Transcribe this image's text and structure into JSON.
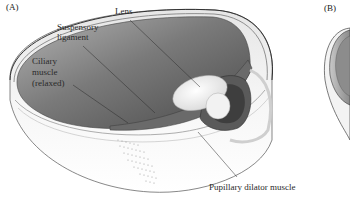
{
  "figure": {
    "panels": [
      {
        "id": "A",
        "label": "(A)"
      },
      {
        "id": "B",
        "label": "(B)"
      }
    ],
    "annotations": {
      "lens": "Lens",
      "suspensory_ligament_line1": "Suspensory",
      "suspensory_ligament_line2": "ligament",
      "ciliary_muscle_line1": "Ciliary",
      "ciliary_muscle_line2": "muscle",
      "ciliary_muscle_line3": "(relaxed)",
      "pupillary_dilator_muscle": "Pupillary dilator muscle"
    },
    "colors": {
      "background": "#ffffff",
      "interior_dark": "#5c5c5c",
      "interior_light": "#a8a8a8",
      "outer_shell": "#f2f2f2",
      "outline": "#3a3a3a",
      "lens": "#f4f4f4"
    }
  }
}
